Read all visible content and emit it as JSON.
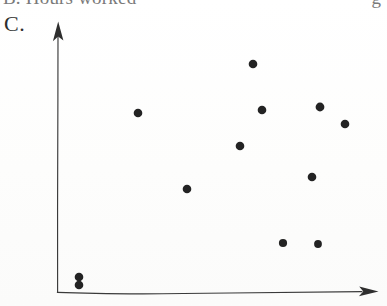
{
  "page": {
    "width": 387,
    "height": 306,
    "background_color": "#ffffff",
    "ink_color": "#232323"
  },
  "header": {
    "truncated_line_text": "B. Hours worked",
    "truncated_line_trailing": "g",
    "note": "top line of scanned page is clipped by the crop"
  },
  "panel": {
    "letter": "C."
  },
  "axes": {
    "origin": {
      "x": 57,
      "y": 292
    },
    "y_axis": {
      "tip_x": 58,
      "tip_y": 22,
      "base_x": 57,
      "base_y": 292,
      "has_arrowhead": true
    },
    "x_axis": {
      "tip_x": 378,
      "tip_y": 292,
      "base_x": 57,
      "base_y": 292,
      "has_arrowhead": true
    },
    "x_label": "",
    "y_label": "",
    "tick_labels_x": [],
    "tick_labels_y": [],
    "grid": false,
    "hand_drawn": true
  },
  "chart_data": {
    "type": "scatter",
    "title": "C.",
    "subtitle": "",
    "xlabel": "",
    "ylabel": "",
    "xlim": [
      0,
      100
    ],
    "ylim": [
      0,
      100
    ],
    "grid": false,
    "legend": false,
    "legend_position": "none",
    "annotations": [],
    "marker": {
      "shape": "circle",
      "radius_px": 4.2,
      "color": "#232323"
    },
    "n_points": 12,
    "points_px": [
      {
        "x": 79,
        "y": 277
      },
      {
        "x": 79,
        "y": 285
      },
      {
        "x": 138,
        "y": 113
      },
      {
        "x": 187,
        "y": 189
      },
      {
        "x": 240,
        "y": 146
      },
      {
        "x": 253,
        "y": 64
      },
      {
        "x": 262,
        "y": 110
      },
      {
        "x": 283,
        "y": 243
      },
      {
        "x": 312,
        "y": 177
      },
      {
        "x": 318,
        "y": 244
      },
      {
        "x": 320,
        "y": 107
      },
      {
        "x": 345,
        "y": 124
      }
    ],
    "x": [
      7,
      7,
      25,
      40,
      57,
      61,
      64,
      70,
      79,
      81,
      82,
      90
    ],
    "y": [
      6,
      3,
      66,
      38,
      54,
      85,
      67,
      18,
      42,
      18,
      68,
      62
    ],
    "pattern": "no clear association (scattered cloud)"
  }
}
